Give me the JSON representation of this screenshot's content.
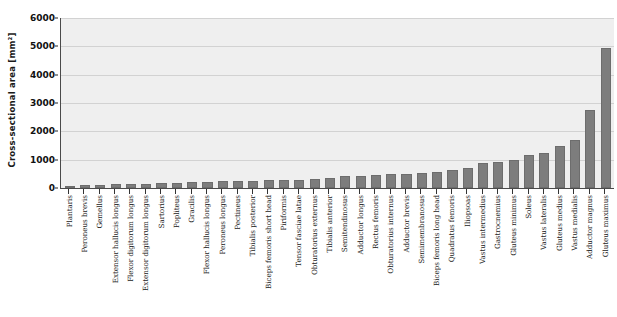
{
  "chart_data": {
    "type": "bar",
    "title": "",
    "xlabel": "",
    "ylabel": "Cross-sectional area [mm²]",
    "ylim": [
      0,
      6000
    ],
    "yticks": [
      0,
      1000,
      2000,
      3000,
      4000,
      5000,
      6000
    ],
    "ytick_labels": [
      "0",
      "1000",
      "2000",
      "3000",
      "4000",
      "5000",
      "6000"
    ],
    "grid": true,
    "legend": "none",
    "bar_color": "#7d7d7d",
    "plot_background": "#efefef",
    "gridline_color": "#d2d2d2",
    "axis_color": "#4a4a4a",
    "categories": [
      "Plantaris",
      "Peroneus brevis",
      "Gemellus",
      "Extensor hallucis longus",
      "Flexor digitorum longus",
      "Extensor digitorum longus",
      "Sartorius",
      "Popliteus",
      "Gracilis",
      "Flexor hallucis longus",
      "Peroneus longus",
      "Pectineus",
      "Tibialis posterior",
      "Biceps femoris short head",
      "Piriformis",
      "Tensor fasciae latae",
      "Obturatorius externus",
      "Tibialis anterior",
      "Semitendinosus",
      "Adductor longus",
      "Rectus femoris",
      "Obturatorius internus",
      "Adductor brevis",
      "Semimembranosus",
      "Biceps femoris long head",
      "Quadratus femoris",
      "Iliopsoas",
      "Vastus intermedius",
      "Gastrocnemius",
      "Gluteus minimus",
      "Soleus",
      "Vastus lateralis",
      "Gluteus medius",
      "Vastus medialis",
      "Adductor magnus",
      "Gluteus maximus"
    ],
    "values": [
      50,
      110,
      120,
      130,
      140,
      145,
      160,
      170,
      200,
      215,
      230,
      250,
      260,
      270,
      290,
      300,
      330,
      350,
      410,
      430,
      470,
      490,
      510,
      540,
      560,
      620,
      700,
      900,
      930,
      1000,
      1150,
      1230,
      1500,
      1700,
      2750,
      4950
    ]
  }
}
